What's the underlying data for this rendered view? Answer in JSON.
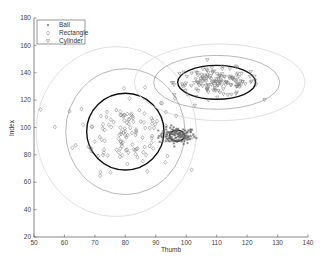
{
  "chart_data": {
    "type": "scatter",
    "title": "",
    "xlabel": "Thumb",
    "ylabel": "Index",
    "xlim": [
      50,
      140
    ],
    "ylim": [
      20,
      180
    ],
    "xticks": [
      50,
      60,
      70,
      80,
      90,
      100,
      110,
      120,
      130,
      140
    ],
    "yticks": [
      20,
      40,
      60,
      80,
      100,
      120,
      140,
      160,
      180
    ],
    "grid": false,
    "legend": {
      "position": "upper-left",
      "entries": [
        {
          "label": "Ball",
          "marker": "*"
        },
        {
          "label": "Rectangle",
          "marker": "diamond"
        },
        {
          "label": "Cylinder",
          "marker": "triangle-down"
        }
      ]
    },
    "series": [
      {
        "name": "Ball",
        "marker": "*",
        "center": [
          97,
          94
        ],
        "spread": [
          3,
          3
        ],
        "count": 120,
        "ellipses": [
          {
            "level": "inner",
            "cx": 97,
            "cy": 94,
            "rx": 2.5,
            "ry": 4,
            "style": "thick"
          }
        ]
      },
      {
        "name": "Rectangle",
        "marker": "diamond",
        "center": [
          80,
          97
        ],
        "spread": [
          8,
          14
        ],
        "count": 130,
        "ellipses": [
          {
            "level": "inner",
            "cx": 80,
            "cy": 97,
            "rx": 12.7,
            "ry": 28,
            "style": "thick"
          },
          {
            "level": "middle",
            "cx": 80,
            "cy": 97,
            "rx": 19.6,
            "ry": 46,
            "style": "medium"
          },
          {
            "level": "outer",
            "cx": 77,
            "cy": 97,
            "rx": 26.3,
            "ry": 62,
            "style": "light"
          }
        ]
      },
      {
        "name": "Cylinder",
        "marker": "triangle-down",
        "center": [
          110,
          133
        ],
        "spread": [
          7,
          5
        ],
        "count": 150,
        "ellipses": [
          {
            "level": "inner",
            "cx": 110,
            "cy": 133,
            "rx": 12.8,
            "ry": 12.4,
            "style": "thick"
          },
          {
            "level": "middle",
            "cx": 110,
            "cy": 133,
            "rx": 20.7,
            "ry": 19.7,
            "style": "medium"
          },
          {
            "level": "outer",
            "cx": 111,
            "cy": 133,
            "rx": 28,
            "ry": 28,
            "style": "light"
          }
        ]
      }
    ]
  },
  "colors": {
    "axis": "#555555",
    "marker": "#777777",
    "ellipse_thick": "#111111",
    "ellipse_medium": "#888888",
    "ellipse_light": "#d8d8d8"
  }
}
